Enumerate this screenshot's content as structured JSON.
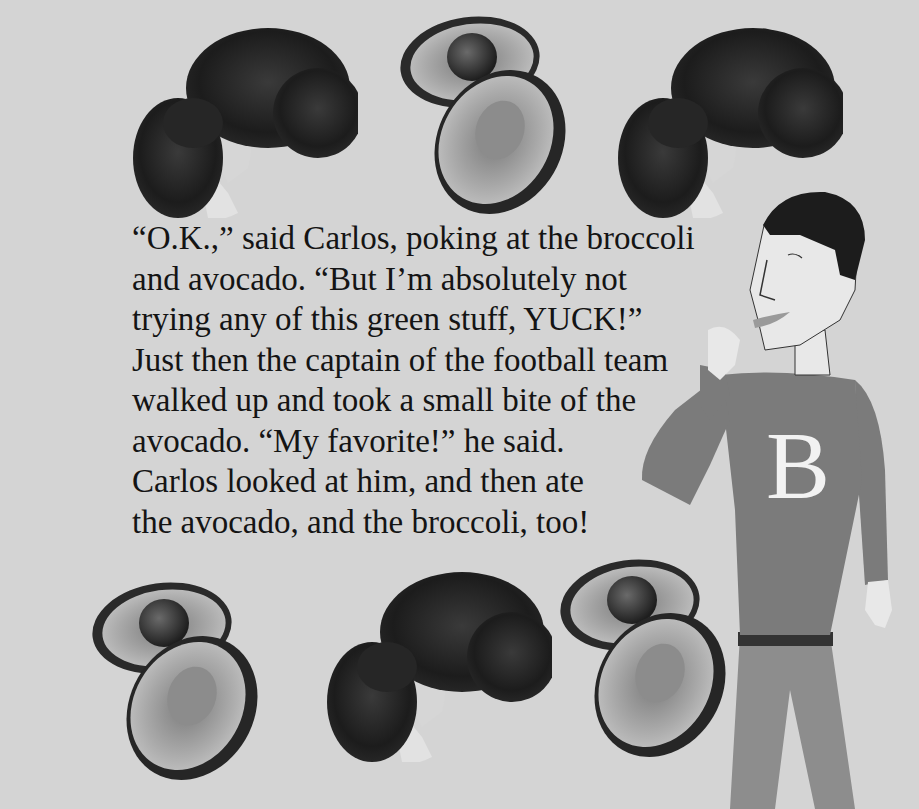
{
  "page": {
    "background": "#d4d4d4"
  },
  "story": {
    "lines": [
      "“O.K.,” said Carlos, poking at the broccoli",
      "and avocado.  “But I’m absolutely not",
      "trying any of this green stuff, YUCK!”",
      "Just then the captain of the football team",
      "walked up and took a small bite of the",
      "avocado.  “My favorite!” he said.",
      "Carlos looked at him, and then ate",
      "the avocado, and the broccoli, too!"
    ]
  },
  "figure": {
    "sweater_letter": "B",
    "sweater_color": "#7a7a7a",
    "pants_color": "#8c8c8c",
    "belt_color": "#333333",
    "skin_color": "#e6e6e6",
    "hair_color": "#1a1a1a"
  },
  "illustrations": {
    "top_row": [
      "broccoli",
      "avocado",
      "broccoli"
    ],
    "bottom_row": [
      "avocado",
      "broccoli",
      "avocado"
    ]
  }
}
